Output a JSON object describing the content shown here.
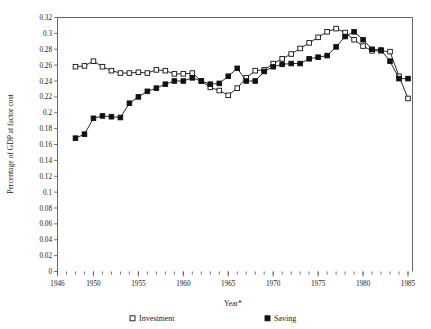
{
  "chart_data": {
    "type": "line",
    "title": "",
    "xlabel": "Year*",
    "ylabel": "Percentage of GDP at factor cost",
    "xlim": [
      1946,
      1985.5
    ],
    "ylim": [
      0,
      0.32
    ],
    "grid": false,
    "legend_position": "bottom",
    "x_tick_labels": [
      "1946",
      "1950",
      "1955",
      "1960",
      "1965",
      "1970",
      "1975",
      "1980",
      "1985"
    ],
    "x_tick_values": [
      1946,
      1950,
      1955,
      1960,
      1965,
      1970,
      1975,
      1980,
      1985
    ],
    "x_minor_step": 1,
    "y_tick_labels": [
      "0",
      "0.02",
      "0.04",
      "0.06",
      "0.08",
      "0.1",
      "0.12",
      "0.14",
      "0.16",
      "0.18",
      "0.2",
      "0.22",
      "0.24",
      "0.26",
      "0.28",
      "0.3",
      "0.32"
    ],
    "y_tick_values": [
      0,
      0.02,
      0.04,
      0.06,
      0.08,
      0.1,
      0.12,
      0.14,
      0.16,
      0.18,
      0.2,
      0.22,
      0.24,
      0.26,
      0.28,
      0.3,
      0.32
    ],
    "x": [
      1948,
      1949,
      1950,
      1951,
      1952,
      1953,
      1954,
      1955,
      1956,
      1957,
      1958,
      1959,
      1960,
      1961,
      1962,
      1963,
      1964,
      1965,
      1966,
      1967,
      1968,
      1969,
      1970,
      1971,
      1972,
      1973,
      1974,
      1975,
      1976,
      1977,
      1978,
      1979,
      1980,
      1981,
      1982,
      1983,
      1984,
      1985
    ],
    "series": [
      {
        "name": "Investment",
        "marker": "open-square",
        "color": "#111111",
        "values": [
          0.258,
          0.259,
          0.265,
          0.258,
          0.253,
          0.25,
          0.25,
          0.251,
          0.25,
          0.254,
          0.253,
          0.249,
          0.249,
          0.25,
          0.24,
          0.232,
          0.228,
          0.222,
          0.231,
          0.244,
          0.253,
          0.254,
          0.262,
          0.268,
          0.274,
          0.281,
          0.288,
          0.295,
          0.302,
          0.306,
          0.301,
          0.292,
          0.284,
          0.278,
          0.278,
          0.277,
          0.246,
          0.218
        ]
      },
      {
        "name": "Saving",
        "marker": "filled-square",
        "color": "#111111",
        "values": [
          0.168,
          0.173,
          0.193,
          0.196,
          0.195,
          0.194,
          0.212,
          0.22,
          0.227,
          0.231,
          0.236,
          0.24,
          0.24,
          0.244,
          0.24,
          0.236,
          0.237,
          0.246,
          0.256,
          0.24,
          0.24,
          0.252,
          0.258,
          0.261,
          0.262,
          0.262,
          0.268,
          0.27,
          0.272,
          0.283,
          0.296,
          0.302,
          0.292,
          0.28,
          0.279,
          0.265,
          0.243,
          0.243
        ]
      }
    ]
  },
  "legend": {
    "entries": [
      {
        "label": "Investment",
        "marker": "open-square"
      },
      {
        "label": "Saving",
        "marker": "filled-square"
      }
    ]
  }
}
